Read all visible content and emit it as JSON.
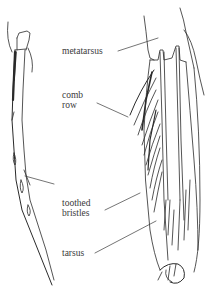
{
  "diagram": {
    "ink_color": "#2a2a2a",
    "labels": [
      {
        "id": "metatarsus",
        "text": "metatarsus"
      },
      {
        "id": "comb",
        "line1": "comb",
        "line2": "row"
      },
      {
        "id": "toothed",
        "line1": "toothed",
        "line2": "bristles"
      },
      {
        "id": "tarsus",
        "text": "tarsus"
      }
    ]
  }
}
